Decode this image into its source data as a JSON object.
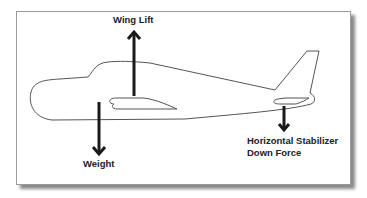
{
  "diagram": {
    "labels": {
      "wing_lift": "Wing Lift",
      "weight": "Weight",
      "stabilizer_line1": "Horizontal Stabilizer",
      "stabilizer_line2": "Down Force"
    },
    "forces": [
      {
        "name": "Wing Lift",
        "direction": "up"
      },
      {
        "name": "Weight",
        "direction": "down"
      },
      {
        "name": "Horizontal Stabilizer Down Force",
        "direction": "down"
      }
    ],
    "colors": {
      "outline": "#555555",
      "arrow": "#1a1a1a",
      "text": "#222222",
      "frame_border": "#9a9a9a",
      "shadow": "#8a8a8a"
    }
  }
}
